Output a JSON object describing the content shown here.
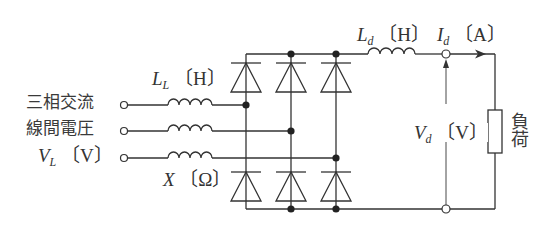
{
  "diagram": {
    "colors": {
      "line": "#333333",
      "background": "#ffffff",
      "text": "#333333"
    },
    "source": {
      "label_line1": "三相交流",
      "label_line2": "線間電圧",
      "voltage_symbol": "V",
      "voltage_subscript": "L",
      "voltage_unit": "〔V〕"
    },
    "line_inductance": {
      "symbol": "L",
      "subscript": "L",
      "unit": "〔H〕"
    },
    "reactance": {
      "symbol": "X",
      "unit": "〔Ω〕"
    },
    "dc_inductance": {
      "symbol": "L",
      "subscript": "d",
      "unit": "〔H〕"
    },
    "dc_current": {
      "symbol": "I",
      "subscript": "d",
      "unit": "〔A〕"
    },
    "dc_voltage": {
      "symbol": "V",
      "subscript": "d",
      "unit": "〔V〕"
    },
    "load": {
      "label": "負荷"
    },
    "components": {
      "phases": 3,
      "diodes_upper": 3,
      "diodes_lower": 3,
      "input_terminals": 3,
      "output_terminals": 2
    }
  }
}
